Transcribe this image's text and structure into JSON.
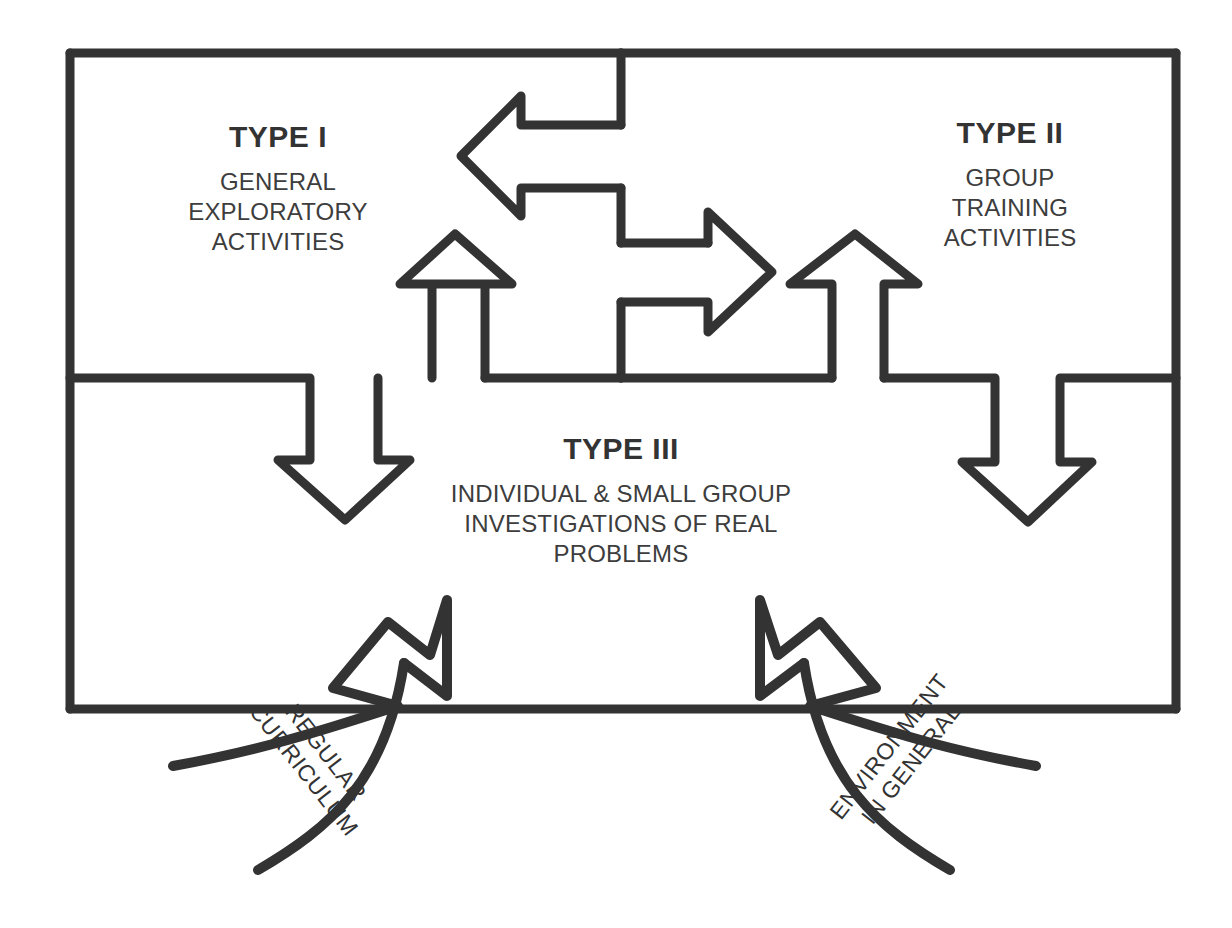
{
  "diagram": {
    "stroke_color": "#333333",
    "background_color": "#ffffff",
    "type": "flow-diagram"
  },
  "boxes": {
    "type1": {
      "heading": "TYPE I",
      "body_lines": [
        "GENERAL",
        "EXPLORATORY",
        "ACTIVITIES"
      ]
    },
    "type2": {
      "heading": "TYPE II",
      "body_lines": [
        "GROUP",
        "TRAINING",
        "ACTIVITIES"
      ]
    },
    "type3": {
      "heading": "TYPE III",
      "body_lines": [
        "INDIVIDUAL & SMALL GROUP",
        "INVESTIGATIONS OF REAL",
        "PROBLEMS"
      ]
    }
  },
  "inputs": {
    "left": {
      "label_lines": [
        "REGULAR",
        "CURRICULUM"
      ]
    },
    "right": {
      "label_lines": [
        "ENVIRONMENT",
        "IN GENERAL"
      ]
    }
  },
  "arrows": [
    {
      "name": "type1-to-type2-bidirectional",
      "direction": "both",
      "orientation": "horizontal"
    },
    {
      "name": "type1-up-arrow",
      "direction": "up",
      "orientation": "vertical"
    },
    {
      "name": "type1-down-arrow",
      "direction": "down",
      "orientation": "vertical"
    },
    {
      "name": "type2-up-arrow",
      "direction": "up",
      "orientation": "vertical"
    },
    {
      "name": "type2-down-arrow",
      "direction": "down",
      "orientation": "vertical"
    },
    {
      "name": "regular-curriculum-input-arrow",
      "direction": "up-right",
      "orientation": "curved"
    },
    {
      "name": "environment-input-arrow",
      "direction": "up-left",
      "orientation": "curved"
    }
  ]
}
